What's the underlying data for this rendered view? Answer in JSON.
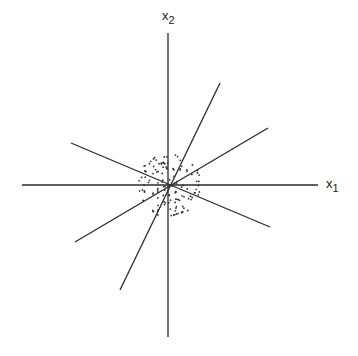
{
  "diagram": {
    "type": "scatter_with_lines",
    "axes": {
      "x_label": {
        "base": "x",
        "sub": "1"
      },
      "y_label": {
        "base": "x",
        "sub": "2"
      },
      "origin": [
        169,
        185
      ],
      "horizontal": {
        "x1": 22,
        "x2": 318,
        "y": 185
      },
      "vertical": {
        "x": 168,
        "y1": 33,
        "y2": 337
      }
    },
    "lines": [
      {
        "name": "steep-positive",
        "x1": 120,
        "y1": 290,
        "x2": 220,
        "y2": 83
      },
      {
        "name": "shallow-positive",
        "x1": 75,
        "y1": 242,
        "x2": 268,
        "y2": 128
      },
      {
        "name": "shallow-negative",
        "x1": 71,
        "y1": 143,
        "x2": 270,
        "y2": 227
      }
    ],
    "cloud": {
      "center": [
        169,
        185
      ],
      "radius": 32,
      "count": 130,
      "dot_color": "#333333"
    },
    "colors": {
      "line": "#2a2a2a",
      "background": "#ffffff"
    }
  }
}
